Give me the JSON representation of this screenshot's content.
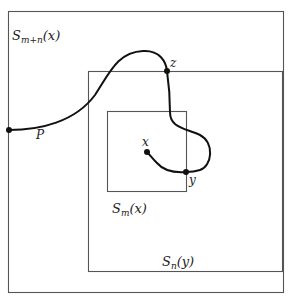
{
  "diagram": {
    "boxes": {
      "outer": {
        "label_main": "S",
        "label_sub": "m+n",
        "label_arg": "(x)"
      },
      "middle": {
        "label_main": "S",
        "label_sub": "n",
        "label_arg": "(y)"
      },
      "inner": {
        "label_main": "S",
        "label_sub": "m",
        "label_arg": "(x)"
      }
    },
    "points": {
      "P": "P",
      "z": "z",
      "x": "x",
      "y": "y"
    },
    "colors": {
      "box_stroke": "#555555",
      "curve_stroke": "#111111",
      "background": "#ffffff"
    }
  }
}
